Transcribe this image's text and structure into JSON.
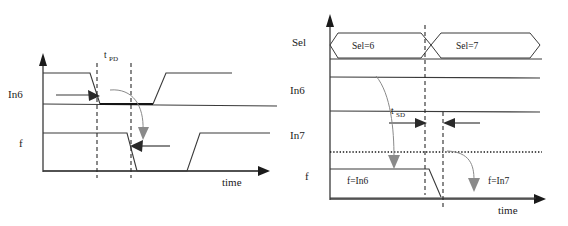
{
  "figure": {
    "title": "",
    "type": "timing-diagram-pair",
    "background_color": "#ffffff",
    "line_color": "#3a3a3a",
    "bold_line_color": "#151515",
    "annotation_curve_color": "#8a8a8a"
  },
  "left_panel": {
    "name": "propagation-delay-timing-diagram",
    "signals": [
      {
        "key": "in6",
        "label": "In6",
        "row": 0
      },
      {
        "key": "f",
        "label": "f",
        "row": 1
      }
    ],
    "axis_label": "time",
    "annotations": {
      "delay_label_base": "t",
      "delay_label_sub": "PD",
      "delay_label_full": "tPD"
    },
    "markers": {
      "dashed_line_1_x": 97,
      "dashed_line_2_x": 131
    },
    "waveform_in6": {
      "description": "high, falls at first dashed marker, low until later, then rises",
      "points": "high-start, fall, low, rise, high-end"
    },
    "waveform_f": {
      "description": "high, falls at second dashed marker, low, then rises later",
      "points": "high-start, fall, low, rise, high-end"
    }
  },
  "right_panel": {
    "name": "select-delay-timing-diagram",
    "signals": [
      {
        "key": "sel",
        "label": "Sel",
        "row": 0
      },
      {
        "key": "in6",
        "label": "In6",
        "row": 1
      },
      {
        "key": "in7",
        "label": "In7",
        "row": 2
      },
      {
        "key": "f",
        "label": "f",
        "row": 3
      }
    ],
    "axis_label": "time",
    "bus_values": [
      {
        "label": "Sel=6",
        "position": "left"
      },
      {
        "label": "Sel=7",
        "position": "right"
      }
    ],
    "f_values": [
      {
        "label": "f=In6",
        "position": "left"
      },
      {
        "label": "f=In7",
        "position": "right"
      }
    ],
    "annotations": {
      "delay_label_base": "t",
      "delay_label_sub": "SD",
      "delay_label_full": "tSD"
    },
    "markers": {
      "dashed_line_1_x": 141,
      "dashed_line_2_x": 165
    }
  }
}
